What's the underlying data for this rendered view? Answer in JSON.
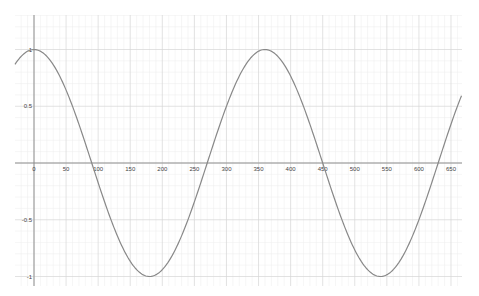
{
  "chart_data": {
    "type": "line",
    "title": "",
    "xlabel": "",
    "ylabel": "",
    "function": "y = cos(x°)",
    "xlim": [
      -30,
      700
    ],
    "ylim": [
      -1.08,
      1.3
    ],
    "grid": true,
    "legend": null,
    "x_ticks": [
      0,
      50,
      100,
      150,
      200,
      250,
      300,
      350,
      400,
      450,
      500,
      550,
      600,
      650
    ],
    "x_tick_labels": [
      "0",
      "50",
      "100",
      "150",
      "200",
      "250",
      "300",
      "350",
      "400",
      "450",
      "500",
      "550",
      "600",
      "650"
    ],
    "y_ticks": [
      1,
      0.5,
      -0.5,
      -1
    ],
    "y_tick_labels": [
      "1",
      "0.5",
      "-0.5",
      "-1"
    ],
    "series": [
      {
        "name": "cos(x)",
        "color": "#888888",
        "x": [
          -30,
          0,
          90,
          180,
          270,
          360,
          450,
          540,
          630,
          690
        ],
        "y": [
          0.866,
          1,
          0,
          -1,
          0,
          1,
          0,
          -1,
          0,
          0.866
        ]
      }
    ],
    "colors": {
      "axis": "#8a8a8a",
      "major_grid": "#d6d6d6",
      "minor_grid": "#ececec",
      "curve": "#8e8e8e"
    }
  }
}
